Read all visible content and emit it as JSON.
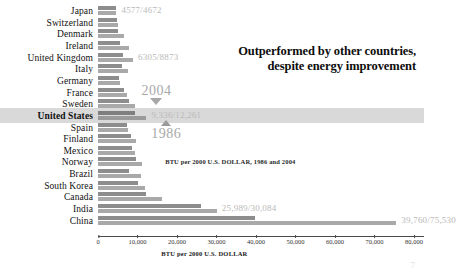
{
  "headline": "Outperformed by other countries, despite energy improvement",
  "page_number": "7",
  "annotations": {
    "year_2004": "2004",
    "year_1986": "1986",
    "inner_note": "BTU per 2000 U.S. DOLLAR, 1986 and 2004"
  },
  "chart_data": {
    "type": "bar",
    "title": "Outperformed by other countries, despite energy improvement",
    "xlabel": "BTU per 2000 U.S. DOLLAR",
    "ylabel": "",
    "xlim": [
      0,
      80000
    ],
    "grid": false,
    "legend_position": "none",
    "orientation": "horizontal",
    "tick_labels": [
      "0",
      "10,000",
      "20,000",
      "30,000",
      "40,000",
      "50,000",
      "60,000",
      "70,000",
      "80,000"
    ],
    "tick_values": [
      0,
      10000,
      20000,
      30000,
      40000,
      50000,
      60000,
      70000,
      80000
    ],
    "categories": [
      "Japan",
      "Switzerland",
      "Denmark",
      "Ireland",
      "United Kingdom",
      "Italy",
      "Germany",
      "France",
      "Sweden",
      "United States",
      "Spain",
      "Finland",
      "Mexico",
      "Norway",
      "Brazil",
      "South Korea",
      "Canada",
      "India",
      "China"
    ],
    "series": [
      {
        "name": "2004",
        "values": [
          4577,
          4800,
          5100,
          5600,
          6305,
          6000,
          5400,
          6700,
          7900,
          9336,
          7300,
          8400,
          8600,
          9700,
          7900,
          10100,
          12100,
          25989,
          39760
        ]
      },
      {
        "name": "1986",
        "values": [
          4672,
          5000,
          6500,
          7800,
          8873,
          7500,
          5600,
          7400,
          9300,
          12261,
          7600,
          9500,
          9300,
          11200,
          11000,
          11800,
          16200,
          30084,
          75530
        ]
      }
    ],
    "data_labels": [
      {
        "category": "Japan",
        "text": "4577/4672"
      },
      {
        "category": "United Kingdom",
        "text": "6305/8873"
      },
      {
        "category": "United States",
        "text": "9,336/12,261"
      },
      {
        "category": "India",
        "text": "25,989/30,084"
      },
      {
        "category": "China",
        "text": "39,760/75,530"
      }
    ],
    "highlighted_category": "United States",
    "colors": {
      "series_2004": "#8d8d8d",
      "series_1986": "#a9a9a9",
      "highlight_band": "#d2d2d2"
    }
  }
}
